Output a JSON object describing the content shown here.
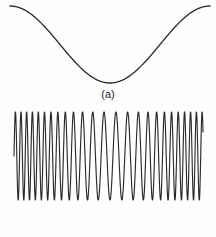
{
  "figure": {
    "background_color": "#fefefe",
    "stroke_color": "#2b2b2b",
    "width": 216,
    "height": 237
  },
  "panels": [
    {
      "id": "a",
      "label": "(a)",
      "role": "modulating-signal",
      "description": "Low-frequency sinusoidal message signal"
    },
    {
      "id": "b",
      "label": "(b)",
      "role": "modulated-carrier",
      "description": "Frequency-modulated carrier whose instantaneous frequency follows the message signal"
    }
  ],
  "chart_data": [
    {
      "type": "line",
      "id": "message-signal",
      "title": "(a)",
      "xlabel": "",
      "ylabel": "",
      "xlim": [
        0,
        1
      ],
      "ylim": [
        -1,
        1
      ],
      "grid": false,
      "legend": "none",
      "axes_visible": false,
      "waveform": "cosine",
      "cycles": 1.0,
      "phase_deg": 0,
      "amplitude": 1.0,
      "samples_x": [
        0,
        0.05,
        0.1,
        0.15,
        0.2,
        0.25,
        0.3,
        0.35,
        0.4,
        0.45,
        0.5,
        0.55,
        0.6,
        0.65,
        0.7,
        0.75,
        0.8,
        0.85,
        0.9,
        0.95,
        1.0
      ],
      "samples_y": [
        1.0,
        0.951,
        0.809,
        0.588,
        0.309,
        0.0,
        -0.309,
        -0.588,
        -0.809,
        -0.951,
        -1.0,
        -0.951,
        -0.809,
        -0.588,
        -0.309,
        0.0,
        0.309,
        0.588,
        0.809,
        0.951,
        1.0
      ],
      "features": {
        "start_value": 1.0,
        "trough_x": 0.5,
        "trough_value": -1.0,
        "peak_x": 1.0,
        "peak_value": 1.0
      }
    },
    {
      "type": "line",
      "id": "fm-carrier",
      "title": "(b)",
      "xlabel": "",
      "ylabel": "",
      "xlim": [
        0,
        1
      ],
      "ylim": [
        -1,
        1
      ],
      "grid": false,
      "legend": "none",
      "axes_visible": false,
      "waveform": "frequency-modulated-sine",
      "carrier_cycles": 26,
      "modulation_index": 9.5,
      "modulating_cycles": 1.0,
      "amplitude": 1.0,
      "instantaneous_frequency_note": "Highest near x=0 and x=0.95 where the message is at maximum; lowest near x=0.5 where the message is at minimum",
      "zero_crossing_density": {
        "left_dense": true,
        "center_sparse": true,
        "right_end_sparse": true
      }
    }
  ]
}
